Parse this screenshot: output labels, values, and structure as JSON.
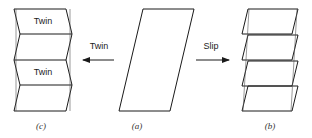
{
  "figure": {
    "panels": {
      "a": {
        "caption": "(a)",
        "description": "original crystal"
      },
      "b": {
        "caption": "(b)",
        "description": "deformed by slip"
      },
      "c": {
        "caption": "(c)",
        "description": "deformed by twinning",
        "twin_labels": [
          "Twin",
          "Twin"
        ]
      }
    },
    "arrows": {
      "twin": {
        "label": "Twin",
        "direction": "left"
      },
      "slip": {
        "label": "Slip",
        "direction": "right"
      }
    },
    "colors": {
      "line": "#1a1a1a",
      "background": "#ffffff"
    }
  }
}
